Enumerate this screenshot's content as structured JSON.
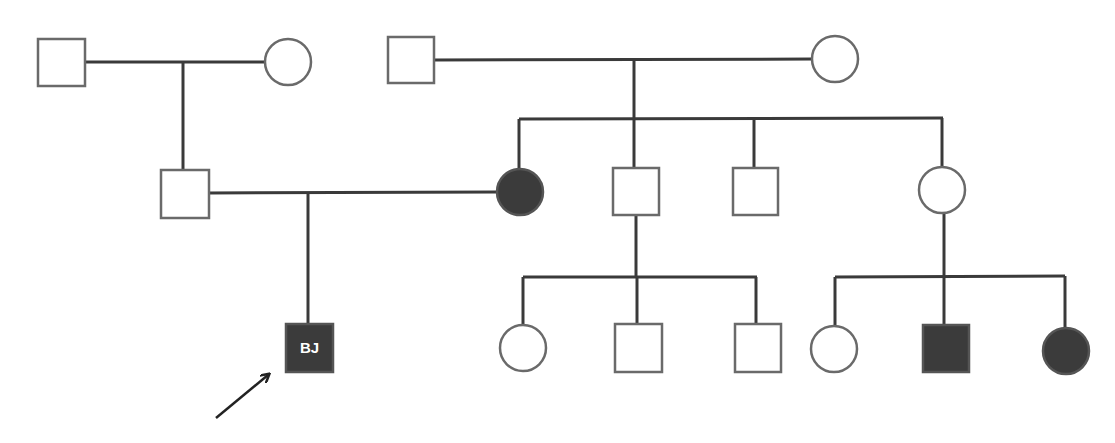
{
  "diagram": {
    "type": "pedigree",
    "colors": {
      "line": "#3a3a3a",
      "affected_fill": "#3b3b3b",
      "unaffected_fill": "#ffffff",
      "label_text": "#ffffff"
    },
    "proband": {
      "label": "BJ",
      "indicator": "arrow"
    },
    "individuals": [
      {
        "id": "I-1",
        "sex": "male",
        "affected": false,
        "generation": 1
      },
      {
        "id": "I-2",
        "sex": "female",
        "affected": false,
        "generation": 1
      },
      {
        "id": "I-3",
        "sex": "male",
        "affected": false,
        "generation": 1
      },
      {
        "id": "I-4",
        "sex": "female",
        "affected": false,
        "generation": 1
      },
      {
        "id": "II-1",
        "sex": "male",
        "affected": false,
        "generation": 2
      },
      {
        "id": "II-2",
        "sex": "female",
        "affected": true,
        "generation": 2
      },
      {
        "id": "II-3",
        "sex": "male",
        "affected": false,
        "generation": 2
      },
      {
        "id": "II-4",
        "sex": "male",
        "affected": false,
        "generation": 2
      },
      {
        "id": "II-5",
        "sex": "female",
        "affected": false,
        "generation": 2
      },
      {
        "id": "III-1",
        "sex": "male",
        "affected": true,
        "generation": 3,
        "label": "BJ",
        "proband": true
      },
      {
        "id": "III-2",
        "sex": "female",
        "affected": false,
        "generation": 3
      },
      {
        "id": "III-3",
        "sex": "male",
        "affected": false,
        "generation": 3
      },
      {
        "id": "III-4",
        "sex": "male",
        "affected": false,
        "generation": 3
      },
      {
        "id": "III-5",
        "sex": "female",
        "affected": false,
        "generation": 3
      },
      {
        "id": "III-6",
        "sex": "male",
        "affected": true,
        "generation": 3
      },
      {
        "id": "III-7",
        "sex": "female",
        "affected": true,
        "generation": 3
      }
    ],
    "unions": [
      {
        "partners": [
          "I-1",
          "I-2"
        ],
        "children": [
          "II-1"
        ]
      },
      {
        "partners": [
          "I-3",
          "I-4"
        ],
        "children": [
          "II-2",
          "II-3",
          "II-4",
          "II-5"
        ]
      },
      {
        "partners": [
          "II-1",
          "II-2"
        ],
        "children": [
          "III-1"
        ]
      },
      {
        "parent": "II-3",
        "children": [
          "III-2",
          "III-3",
          "III-4"
        ]
      },
      {
        "parent": "II-5",
        "children": [
          "III-5",
          "III-6",
          "III-7"
        ]
      }
    ]
  }
}
